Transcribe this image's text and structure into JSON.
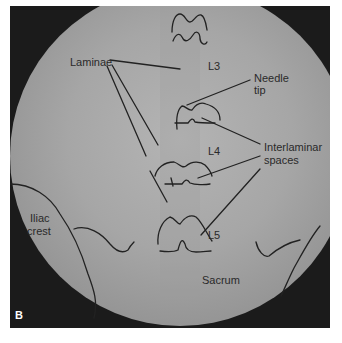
{
  "figure": {
    "panel_letter": "B",
    "background_color": "#1a1a1a",
    "field_color": "#a8a8a8",
    "line_color": "#222222"
  },
  "labels": {
    "laminae": "Laminae",
    "l3": "L3",
    "needle_tip_line1": "Needle",
    "needle_tip_line2": "tip",
    "l4": "L4",
    "interlaminar_line1": "Interlaminar",
    "interlaminar_line2": "spaces",
    "iliac_line1": "Iliac",
    "iliac_line2": "crest",
    "l5": "L5",
    "sacrum": "Sacrum"
  }
}
